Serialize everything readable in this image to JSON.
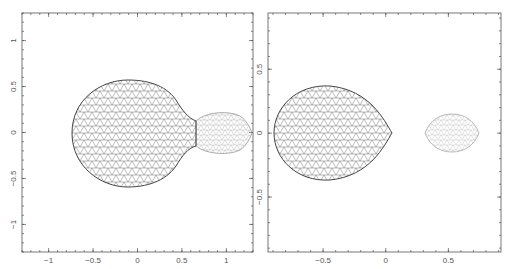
{
  "figure": {
    "panels": [
      {
        "id": "left",
        "description": "Contact configuration: two lobes connected by a neck (triangulated surface mesh)",
        "frame": {
          "x": 22,
          "y": 13,
          "w": 231,
          "h": 239
        },
        "xlim": [
          -1.3,
          1.3
        ],
        "ylim": [
          -1.3,
          1.3
        ],
        "xticks": [
          {
            "v": -1,
            "label": "−1"
          },
          {
            "v": -0.5,
            "label": "−0.5"
          },
          {
            "v": 0,
            "label": "0"
          },
          {
            "v": 0.5,
            "label": "0.5"
          },
          {
            "v": 1,
            "label": "1"
          }
        ],
        "yticks": [
          {
            "v": 1,
            "label": "1"
          },
          {
            "v": 0.5,
            "label": "0.5"
          },
          {
            "v": 0,
            "label": "0"
          },
          {
            "v": -0.5,
            "label": "−0.5"
          },
          {
            "v": -1,
            "label": "−1"
          }
        ],
        "shapes": [
          {
            "name": "primary-lobe",
            "cx": -0.05,
            "rx": 0.7,
            "ry": 0.58,
            "tone": "#555555"
          },
          {
            "name": "secondary-lobe",
            "cx": 0.95,
            "rx": 0.32,
            "ry": 0.2,
            "tone": "#999999"
          }
        ]
      },
      {
        "id": "right",
        "description": "Detached configuration: primary lobe with cusp at inner Lagrange point, separate secondary (triangulated surface mesh)",
        "frame": {
          "x": 268,
          "y": 13,
          "w": 233,
          "h": 239
        },
        "xlim": [
          -0.94,
          0.92
        ],
        "ylim": [
          -0.93,
          0.94
        ],
        "xticks": [
          {
            "v": -0.5,
            "label": "−0.5"
          },
          {
            "v": 0,
            "label": "0"
          },
          {
            "v": 0.5,
            "label": "0.5"
          }
        ],
        "yticks": [
          {
            "v": 0.5,
            "label": "0.5"
          },
          {
            "v": 0,
            "label": "0"
          },
          {
            "v": -0.5,
            "label": "−0.5"
          }
        ],
        "shapes": [
          {
            "name": "primary-lobe",
            "cx": -0.45,
            "rx": 0.45,
            "ry": 0.37,
            "tone": "#555555"
          },
          {
            "name": "secondary-lobe",
            "cx": 0.53,
            "rx": 0.22,
            "ry": 0.15,
            "tone": "#aaaaaa"
          }
        ]
      }
    ]
  }
}
